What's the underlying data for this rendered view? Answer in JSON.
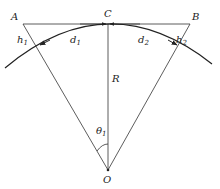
{
  "diagram": {
    "points": {
      "A": "A",
      "B": "B",
      "C": "C",
      "O": "O"
    },
    "labels": {
      "h1": "h",
      "h1_sub": "1",
      "h2": "h",
      "h2_sub": "2",
      "d1": "d",
      "d1_sub": "1",
      "d2": "d",
      "d2_sub": "2",
      "R": "R",
      "theta": "θ",
      "theta_sub": "1"
    },
    "colors": {
      "stroke": "#333333",
      "text": "#222222"
    }
  }
}
